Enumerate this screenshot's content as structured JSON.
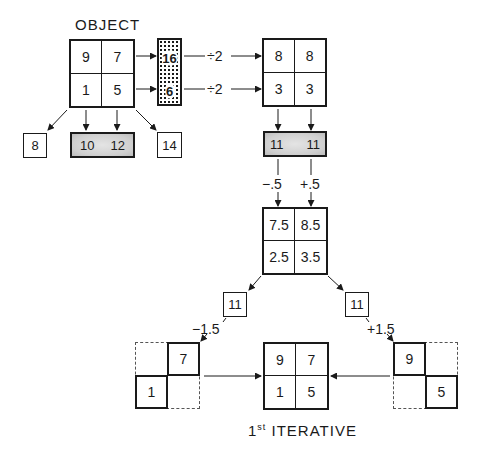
{
  "title_top": "OBJECT",
  "title_bottom": "ITERATIVE",
  "title_bottom_ordinal": "1",
  "title_bottom_sup": "st",
  "object_grid": {
    "tl": "9",
    "tr": "7",
    "bl": "1",
    "br": "5"
  },
  "row_sums": {
    "top": "16",
    "bottom": "6"
  },
  "row_ops": {
    "top": "÷2",
    "bottom": "÷2"
  },
  "row_avg_grid": {
    "tl": "8",
    "tr": "8",
    "bl": "3",
    "br": "3"
  },
  "diag_left": "8",
  "col_sums": {
    "left": "10",
    "right": "12"
  },
  "diag_right": "14",
  "col_projection": {
    "left": "11",
    "right": "11"
  },
  "col_corrections": {
    "left": "−.5",
    "right": "+.5"
  },
  "corrected_grid": {
    "tl": "7.5",
    "tr": "8.5",
    "bl": "2.5",
    "br": "3.5"
  },
  "diag_boxes": {
    "left": "11",
    "right": "11"
  },
  "diag_corrections": {
    "left": "−1.5",
    "right": "+1.5"
  },
  "left_partial": {
    "tr": "7",
    "bl": "1"
  },
  "result_grid": {
    "tl": "9",
    "tr": "7",
    "bl": "1",
    "br": "5"
  },
  "right_partial": {
    "tl": "9",
    "br": "5"
  }
}
